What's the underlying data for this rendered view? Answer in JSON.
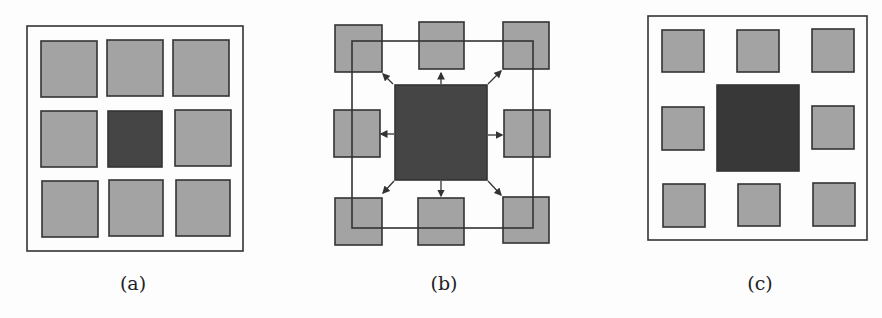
{
  "figure": {
    "panels": [
      {
        "id": "a",
        "caption": "(a)"
      },
      {
        "id": "b",
        "caption": "(b)"
      },
      {
        "id": "c",
        "caption": "(c)"
      }
    ]
  },
  "colors": {
    "light_square": "#a3a3a3",
    "dark_square": "#454545",
    "stroke": "#333333",
    "background": "#fdfdfd"
  }
}
